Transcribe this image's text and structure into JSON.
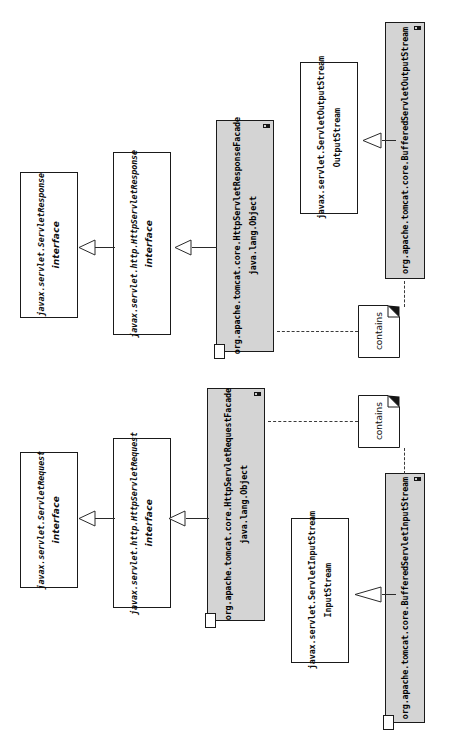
{
  "diagram": {
    "type": "uml-class-diagram",
    "orientation": "rotated-90-ccw",
    "colors": {
      "facade_fill": "#d4d4d4",
      "box_fill": "#ffffff",
      "stroke": "#1a1a1a",
      "shadow": "#111111"
    }
  },
  "response_group": {
    "servlet_response_interface": {
      "stereotype": "interface",
      "name": "javax.servlet.ServletResponse"
    },
    "http_servlet_response_interface": {
      "stereotype": "interface",
      "name": "javax.servlet.http.HttpServletResponse"
    },
    "http_servlet_response_facade": {
      "superclass": "java.lang.Object",
      "name": "org.apache.tomcat.core.HttpServletResponseFacade"
    },
    "servlet_output_stream": {
      "superclass": "OutputStream",
      "name": "javax.servlet.ServletOutputStream"
    },
    "buffered_servlet_output_stream": {
      "name": "org.apache.tomcat.core.BufferedServletOutputStream"
    },
    "contains_note": {
      "label": "contains"
    }
  },
  "request_group": {
    "servlet_request_interface": {
      "stereotype": "interface",
      "name": "javax.servlet.ServletRequest"
    },
    "http_servlet_request_interface": {
      "stereotype": "interface",
      "name": "javax.servlet.http.HttpServletRequest"
    },
    "http_servlet_request_facade": {
      "superclass": "java.lang.Object",
      "name": "org.apache.tomcat.core.HttpServletRequestFacade"
    },
    "servlet_input_stream": {
      "superclass": "InputStream",
      "name": "javax.servlet.ServletInputStream"
    },
    "buffered_servlet_input_stream": {
      "name": "org.apache.tomcat.core.BufferedServletInputStream"
    },
    "contains_note": {
      "label": "contains"
    }
  }
}
